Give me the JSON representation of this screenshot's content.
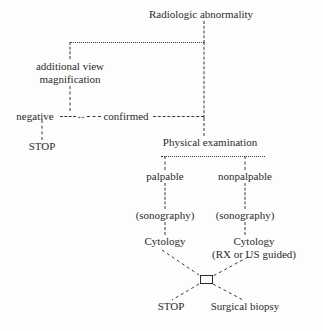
{
  "diagram": {
    "type": "flowchart",
    "title_node": "Radiologic abnormality",
    "nodes": {
      "radiologic_abnormality": "Radiologic abnormality",
      "additional_view": "additional view",
      "magnification": "magnification",
      "negative": "negative",
      "confirmed": "confirmed",
      "stop_left": "STOP",
      "physical_examination": "Physical examination",
      "palpable": "palpable",
      "nonpalpable": "nonpalpable",
      "sonography_left": "(sonography)",
      "sonography_right": "(sonography)",
      "cytology_left": "Cytology",
      "cytology_right": "Cytology",
      "cytology_right_sub": "(RX or US guided)",
      "stop_bottom": "STOP",
      "surgical_biopsy": "Surgical biopsy"
    },
    "connector_glyphs": {
      "bidirectional_arrow": "↔",
      "dash_run": "---"
    },
    "colors": {
      "background": "#fdfdfd",
      "ink": "#2b2b2b",
      "connector": "#3a3a3a"
    }
  }
}
